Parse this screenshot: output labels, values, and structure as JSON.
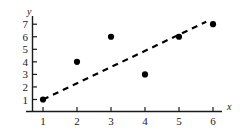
{
  "chart_data": {
    "type": "scatter",
    "title": "",
    "subtitle": "",
    "xlabel": "x",
    "ylabel": "y",
    "xlim": [
      0,
      6.6
    ],
    "ylim": [
      0,
      7.6
    ],
    "grid": false,
    "legend": false,
    "x_ticks": [
      1,
      2,
      3,
      4,
      5,
      6
    ],
    "y_ticks": [
      1,
      2,
      3,
      4,
      5,
      6,
      7
    ],
    "x_tick_labels": [
      "1",
      "2",
      "3",
      "4",
      "5",
      "6"
    ],
    "y_tick_labels": [
      "1",
      "2",
      "3",
      "4",
      "5",
      "6",
      "7"
    ],
    "series": [
      {
        "name": "data points",
        "type": "scatter",
        "marker": "filled-circle",
        "color": "#000000",
        "x": [
          1,
          2,
          3,
          4,
          5,
          6
        ],
        "y": [
          1,
          4,
          6,
          3,
          6,
          7
        ],
        "points": [
          {
            "x": 1,
            "y": 1
          },
          {
            "x": 2,
            "y": 4
          },
          {
            "x": 3,
            "y": 6
          },
          {
            "x": 4,
            "y": 3
          },
          {
            "x": 5,
            "y": 6
          },
          {
            "x": 6,
            "y": 7
          }
        ]
      },
      {
        "name": "trend line",
        "type": "line",
        "style": "dashed",
        "color": "#000000",
        "x": [
          1,
          5.8
        ],
        "y": [
          1,
          7.2
        ],
        "points": [
          {
            "x": 1,
            "y": 1
          },
          {
            "x": 5.8,
            "y": 7.2
          }
        ]
      }
    ],
    "annotations": []
  },
  "axes": {
    "x_axis_label": "x",
    "y_axis_label": "y"
  }
}
